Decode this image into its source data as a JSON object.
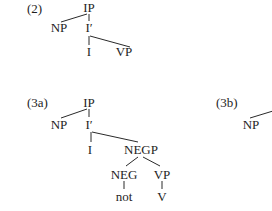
{
  "diagram": {
    "type": "syntax-tree",
    "trees": [
      {
        "id": "2",
        "label": "(2)",
        "nodes": {
          "root": "IP",
          "spec": "NP",
          "bar": "I′",
          "head": "I",
          "comp": "VP"
        },
        "edges": [
          [
            "IP",
            "NP"
          ],
          [
            "IP",
            "I′"
          ],
          [
            "I′",
            "I"
          ],
          [
            "I′",
            "VP"
          ]
        ]
      },
      {
        "id": "3a",
        "label": "(3a)",
        "nodes": {
          "root": "IP",
          "spec": "NP",
          "bar": "I′",
          "head": "I",
          "negp": "NEGP",
          "neg": "NEG",
          "vp": "VP",
          "not": "not",
          "v": "V"
        },
        "edges": [
          [
            "IP",
            "NP"
          ],
          [
            "IP",
            "I′"
          ],
          [
            "I′",
            "I"
          ],
          [
            "I′",
            "NEGP"
          ],
          [
            "NEGP",
            "NEG"
          ],
          [
            "NEGP",
            "VP"
          ],
          [
            "NEG",
            "not"
          ],
          [
            "VP",
            "V"
          ]
        ]
      },
      {
        "id": "3b",
        "label": "(3b)",
        "nodes": {
          "spec": "NP"
        },
        "edges": [
          [
            "(cut off)",
            "NP"
          ]
        ],
        "note": "tree truncated at right edge"
      }
    ]
  }
}
